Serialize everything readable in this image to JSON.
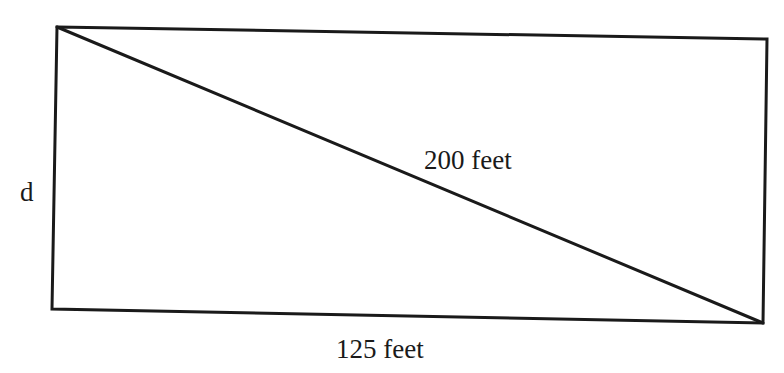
{
  "diagram": {
    "shape": "rectangle-with-diagonal",
    "stroke_color": "#1a1a1a",
    "background_color": "#ffffff",
    "vertices": {
      "top_left": [
        57,
        27
      ],
      "top_right": [
        767,
        39
      ],
      "bottom_right": [
        763,
        323
      ],
      "bottom_left": [
        52,
        309
      ]
    },
    "labels": {
      "side": "d",
      "diagonal": "200 feet",
      "bottom": "125 feet"
    }
  }
}
